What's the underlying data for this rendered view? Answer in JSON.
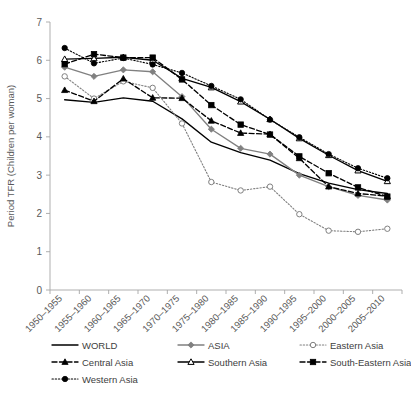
{
  "chart_data": {
    "type": "line",
    "title": "",
    "xlabel": "",
    "ylabel": "Period TFR (Children per woman)",
    "ylim": [
      0,
      7
    ],
    "yticks": [
      0,
      1,
      2,
      3,
      4,
      5,
      6,
      7
    ],
    "grid": false,
    "legend_position": "bottom",
    "categories": [
      "1950–1955",
      "1955–1960",
      "1960–1965",
      "1965–1970",
      "1970–1975",
      "1975–1980",
      "1980–1985",
      "1985–1990",
      "1990–1995",
      "1995–2000",
      "2000–2005",
      "2005–2010"
    ],
    "series": [
      {
        "name": "WORLD",
        "marker": "none",
        "line": "solid",
        "color": "#000000",
        "values": [
          4.97,
          4.9,
          5.02,
          4.93,
          4.47,
          3.86,
          3.59,
          3.39,
          3.04,
          2.79,
          2.62,
          2.52
        ]
      },
      {
        "name": "ASIA",
        "marker": "diamond-filled",
        "line": "solid",
        "color": "#808080",
        "values": [
          5.82,
          5.58,
          5.75,
          5.7,
          5.05,
          4.2,
          3.7,
          3.55,
          3.0,
          2.7,
          2.47,
          2.35
        ]
      },
      {
        "name": "Eastern Asia",
        "marker": "circle-open",
        "line": "dotted",
        "color": "#808080",
        "values": [
          5.58,
          5.0,
          5.45,
          5.28,
          4.35,
          2.82,
          2.6,
          2.7,
          1.98,
          1.55,
          1.52,
          1.6
        ]
      },
      {
        "name": "Central Asia",
        "marker": "triangle-filled",
        "line": "dashed",
        "color": "#000000",
        "values": [
          5.22,
          4.93,
          5.52,
          5.02,
          5.01,
          4.42,
          4.1,
          4.07,
          3.44,
          2.7,
          2.52,
          2.45
        ]
      },
      {
        "name": "Southern Asia",
        "marker": "triangle-open",
        "line": "solid",
        "color": "#000000",
        "values": [
          6.03,
          6.05,
          6.08,
          6.0,
          5.53,
          5.29,
          4.92,
          4.46,
          3.96,
          3.52,
          3.12,
          2.84
        ]
      },
      {
        "name": "South-Eastern Asia",
        "marker": "square-filled",
        "line": "dashed",
        "color": "#000000",
        "values": [
          5.9,
          6.16,
          6.07,
          6.07,
          5.5,
          4.83,
          4.32,
          4.06,
          3.49,
          3.05,
          2.68,
          2.44
        ]
      },
      {
        "name": "Western Asia",
        "marker": "circle-filled",
        "line": "dotted",
        "color": "#000000",
        "values": [
          6.32,
          5.92,
          6.06,
          5.89,
          5.67,
          5.33,
          4.98,
          4.45,
          3.99,
          3.55,
          3.18,
          2.92
        ]
      }
    ]
  },
  "legend": {
    "items": [
      {
        "label": "WORLD",
        "marker": "none",
        "line": "solid",
        "color": "#000000"
      },
      {
        "label": "ASIA",
        "marker": "diamond-filled",
        "line": "solid",
        "color": "#808080"
      },
      {
        "label": "Eastern Asia",
        "marker": "circle-open",
        "line": "dotted",
        "color": "#808080"
      },
      {
        "label": "Central Asia",
        "marker": "triangle-filled",
        "line": "dashed",
        "color": "#000000"
      },
      {
        "label": "Southern Asia",
        "marker": "triangle-open",
        "line": "solid",
        "color": "#000000"
      },
      {
        "label": "South-Eastern Asia",
        "marker": "square-filled",
        "line": "dashed",
        "color": "#000000"
      },
      {
        "label": "Western Asia",
        "marker": "circle-filled",
        "line": "dotted",
        "color": "#000000"
      }
    ]
  }
}
